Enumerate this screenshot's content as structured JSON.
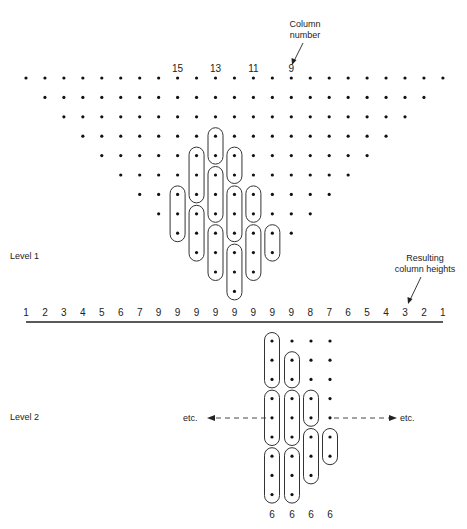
{
  "figure": {
    "column_number_annotation": {
      "line1": "Column",
      "line2": "number"
    },
    "column_labels": [
      {
        "text": "15",
        "col": 8
      },
      {
        "text": "13",
        "col": 10
      },
      {
        "text": "11",
        "col": 12
      },
      {
        "text": "9",
        "col": 14
      }
    ],
    "resulting_heights_annotation": {
      "line1": "Resulting",
      "line2": "column heights"
    },
    "level1": {
      "label": "Level 1",
      "num_columns": 23,
      "num_rows": 12,
      "ovals": [
        {
          "col": 8,
          "rows": [
            6,
            8
          ]
        },
        {
          "col": 9,
          "rows": [
            4,
            6
          ]
        },
        {
          "col": 9,
          "rows": [
            7,
            9
          ]
        },
        {
          "col": 10,
          "rows": [
            3,
            4
          ]
        },
        {
          "col": 10,
          "rows": [
            5,
            7
          ]
        },
        {
          "col": 10,
          "rows": [
            8,
            10
          ]
        },
        {
          "col": 11,
          "rows": [
            4,
            5
          ]
        },
        {
          "col": 11,
          "rows": [
            6,
            8
          ]
        },
        {
          "col": 11,
          "rows": [
            9,
            11
          ]
        },
        {
          "col": 12,
          "rows": [
            6,
            7
          ]
        },
        {
          "col": 12,
          "rows": [
            8,
            10
          ]
        },
        {
          "col": 13,
          "rows": [
            8,
            9
          ]
        }
      ],
      "resulting_column_heights": [
        1,
        2,
        3,
        4,
        5,
        6,
        7,
        9,
        9,
        9,
        9,
        9,
        9,
        9,
        9,
        8,
        7,
        6,
        5,
        4,
        3,
        2,
        1
      ]
    },
    "level2": {
      "label": "Level 2",
      "etc_left": "etc.",
      "etc_right": "etc.",
      "column_dot_counts": [
        9,
        9,
        8,
        7
      ],
      "ovals": [
        {
          "col": 0,
          "rows": [
            0,
            2
          ]
        },
        {
          "col": 0,
          "rows": [
            3,
            5
          ]
        },
        {
          "col": 0,
          "rows": [
            6,
            8
          ]
        },
        {
          "col": 1,
          "rows": [
            1,
            2
          ]
        },
        {
          "col": 1,
          "rows": [
            3,
            5
          ]
        },
        {
          "col": 1,
          "rows": [
            6,
            8
          ]
        },
        {
          "col": 2,
          "rows": [
            3,
            4
          ]
        },
        {
          "col": 2,
          "rows": [
            5,
            7
          ]
        },
        {
          "col": 3,
          "rows": [
            5,
            6
          ]
        }
      ],
      "resulting_column_heights": [
        6,
        6,
        6,
        6
      ]
    }
  }
}
